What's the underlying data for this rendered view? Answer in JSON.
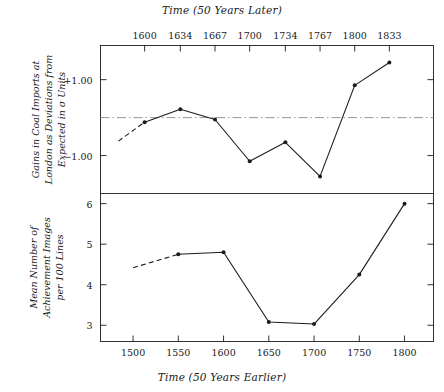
{
  "chart_data": [
    {
      "type": "line",
      "panel": "top",
      "title": "",
      "ylabel": "Gains in Coal Imports at London as Deviations from Expected in σ Units",
      "xlabel": "Time (50 Years Later)",
      "x_axis_position": "top",
      "xticks": [
        1600,
        1634,
        1667,
        1700,
        1734,
        1767,
        1800,
        1833
      ],
      "xticklabels": [
        "1600",
        "1634",
        "1667",
        "1700",
        "1734",
        "1767",
        "1800",
        "1833"
      ],
      "yticks": [
        1.0,
        -1.0
      ],
      "yticklabels": [
        "+1.00",
        "−1.00"
      ],
      "ylim": [
        -2.0,
        1.9
      ],
      "xlim": [
        1558,
        1875
      ],
      "grid": false,
      "zero_reference_line": {
        "value": 0,
        "style": "dash-dot"
      },
      "x": [
        1575,
        1600,
        1634,
        1667,
        1700,
        1734,
        1767,
        1800,
        1833
      ],
      "values": [
        -0.62,
        -0.12,
        0.22,
        -0.05,
        -1.15,
        -0.65,
        -1.55,
        0.85,
        1.45
      ],
      "leading_segment_dashed": true,
      "markers": [
        false,
        true,
        true,
        true,
        true,
        true,
        true,
        true,
        true
      ]
    },
    {
      "type": "line",
      "panel": "bottom",
      "title": "",
      "ylabel": "Mean Number of Achievement Images per 100 Lines",
      "xlabel": "Time (50 Years Earlier)",
      "x_axis_position": "bottom",
      "xticks": [
        1500,
        1550,
        1600,
        1650,
        1700,
        1750,
        1800
      ],
      "xticklabels": [
        "1500",
        "1550",
        "1600",
        "1650",
        "1700",
        "1750",
        "1800"
      ],
      "yticks": [
        3,
        4,
        5,
        6
      ],
      "yticklabels": [
        "3",
        "4",
        "5",
        "6"
      ],
      "ylim": [
        2.6,
        6.25
      ],
      "xlim": [
        1464,
        1832
      ],
      "grid": false,
      "x": [
        1500,
        1550,
        1600,
        1650,
        1700,
        1750,
        1800
      ],
      "values": [
        4.42,
        4.75,
        4.8,
        3.08,
        3.03,
        4.25,
        6.0
      ],
      "leading_segment_dashed": true,
      "markers": [
        false,
        true,
        true,
        true,
        true,
        true,
        true
      ]
    }
  ]
}
